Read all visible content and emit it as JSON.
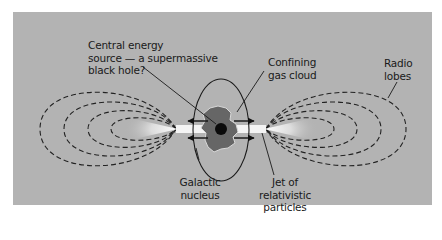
{
  "figure": {
    "type": "active-galactic-nucleus schematic",
    "colors": {
      "background": "#b3b3b3",
      "page": "#ffffff",
      "lines": "#1a1a1a",
      "gas_cloud": "#6a6a6a",
      "black_hole": "#0a0a0a",
      "jet": "#f4f4f4"
    }
  },
  "labels": {
    "central_energy_source": [
      "Central energy",
      "source — a supermassive",
      "black hole?"
    ],
    "confining_gas_cloud": [
      "Confining",
      "gas cloud"
    ],
    "radio_lobes": [
      "Radio",
      "lobes"
    ],
    "galactic_nucleus": [
      "Galactic",
      "nucleus"
    ],
    "jet": [
      "Jet of",
      "relativistic",
      "particles"
    ]
  }
}
